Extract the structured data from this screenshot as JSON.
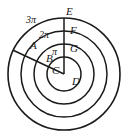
{
  "figure": {
    "type": "concentric-circles-diagram",
    "background_color": "#ffffff",
    "stroke_color": "#1a1a1a",
    "text_color": "#1a1a1a",
    "center": {
      "x": 64,
      "y": 74,
      "label": "D"
    },
    "circles": [
      {
        "name": "inner-circle",
        "radius": 17,
        "ring_label": ""
      },
      {
        "name": "second-circle",
        "radius": 30,
        "ring_label": "π"
      },
      {
        "name": "third-circle",
        "radius": 43,
        "ring_label": "2π"
      },
      {
        "name": "outer-circle",
        "radius": 56,
        "ring_label": "3π"
      }
    ],
    "radii_lines": [
      {
        "name": "vertical-radius",
        "from": "D",
        "to": "E",
        "angle_deg": 90
      },
      {
        "name": "diagonal-radius",
        "from": "D",
        "to": "A",
        "angle_deg": 155
      }
    ],
    "points": [
      {
        "id": "A",
        "label": "A",
        "x": 30,
        "y": 40,
        "on": "outer-circle"
      },
      {
        "id": "B",
        "label": "B",
        "x": 46,
        "y": 53,
        "on": "third-circle"
      },
      {
        "id": "C",
        "label": "C",
        "x": 52,
        "y": 65,
        "on": "second-circle"
      },
      {
        "id": "D",
        "label": "D",
        "x": 72,
        "y": 76,
        "on": "center"
      },
      {
        "id": "E",
        "label": "E",
        "x": 66,
        "y": 6,
        "on": "outer-circle"
      },
      {
        "id": "F",
        "label": "F",
        "x": 70,
        "y": 25,
        "on": "third-circle"
      },
      {
        "id": "G",
        "label": "G",
        "x": 70,
        "y": 43,
        "on": "second-circle"
      }
    ],
    "arc_labels": [
      {
        "id": "arc-3pi",
        "label": "3π",
        "x": 26,
        "y": 15
      },
      {
        "id": "arc-2pi",
        "label": "2π",
        "x": 39,
        "y": 30
      },
      {
        "id": "arc-pi",
        "label": "π",
        "x": 52,
        "y": 47
      }
    ]
  }
}
